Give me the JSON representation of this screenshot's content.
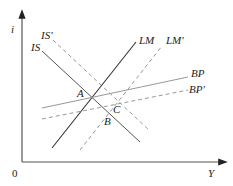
{
  "diagram": {
    "type": "IS-LM-BP",
    "axes": {
      "y_label": "i",
      "x_label": "Y",
      "origin_label": "0"
    },
    "curves": [
      {
        "id": "IS",
        "label": "IS",
        "style": "solid"
      },
      {
        "id": "IS_prime",
        "label": "IS'",
        "style": "dashed"
      },
      {
        "id": "LM",
        "label": "LM",
        "style": "solid"
      },
      {
        "id": "LM_prime",
        "label": "LM'",
        "style": "dashed"
      },
      {
        "id": "BP",
        "label": "BP",
        "style": "solid"
      },
      {
        "id": "BP_prime",
        "label": "BP'",
        "style": "dashed"
      }
    ],
    "points": [
      {
        "id": "A",
        "label": "A"
      },
      {
        "id": "B",
        "label": "B"
      },
      {
        "id": "C",
        "label": "C"
      }
    ],
    "colors": {
      "axis": "#333333",
      "solid": "#333333",
      "dashed": "#888888",
      "light": "#999999"
    }
  }
}
